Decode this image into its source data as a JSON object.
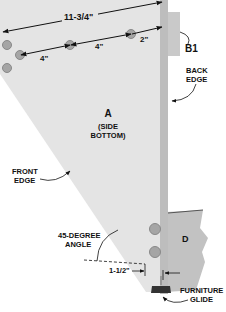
{
  "diagram": {
    "parts": {
      "A": {
        "letter": "A",
        "line1": "(SIDE",
        "line2": "BOTTOM)"
      },
      "B1": {
        "label": "B1"
      },
      "D": {
        "label": "D"
      }
    },
    "dimensions": {
      "overall": "11-3/4\"",
      "spacing_1": "4\"",
      "spacing_2": "4\"",
      "end_offset": "2\"",
      "glide_offset": "1-1/2\""
    },
    "callouts": {
      "back_edge": {
        "line1": "BACK",
        "line2": "EDGE"
      },
      "front_edge": {
        "line1": "FRONT",
        "line2": "EDGE"
      },
      "angle": {
        "line1": "45-DEGREE",
        "line2": "ANGLE"
      },
      "glide": {
        "line1": "FURNITURE",
        "line2": "GLIDE"
      }
    },
    "colors": {
      "panel": "#e4e4e4",
      "panel_edge": "#bdbdbd",
      "block": "#c9c9c9",
      "text": "#111111",
      "screw": "#9a9a9a"
    }
  }
}
